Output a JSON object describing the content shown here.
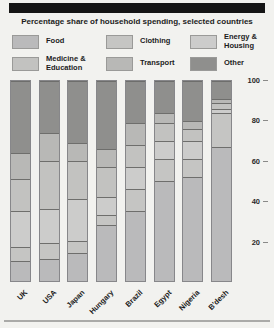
{
  "title": "Percentage share of household spending, selected countries",
  "chart_data": {
    "type": "bar",
    "subtype": "stacked-percentage-column",
    "title": "Percentage share of household spending, selected countries",
    "categories": [
      "UK",
      "USA",
      "Japan",
      "Hungary",
      "Brazil",
      "Egypt",
      "Nigeria",
      "B'desh"
    ],
    "series": [
      {
        "name": "Food",
        "color": "#bababb",
        "values": [
          10,
          11,
          14,
          28,
          35,
          50,
          52,
          67
        ]
      },
      {
        "name": "Clothing",
        "color": "#c5c5c3",
        "values": [
          7,
          8,
          6,
          5,
          11,
          11,
          9,
          17
        ]
      },
      {
        "name": "Energy & Housing",
        "color": "#cccccb",
        "values": [
          18,
          17,
          21,
          9,
          11,
          9,
          9,
          2
        ]
      },
      {
        "name": "Medicine & Education",
        "color": "#c2c2c0",
        "values": [
          16,
          24,
          19,
          15,
          11,
          9,
          6,
          3
        ]
      },
      {
        "name": "Transport",
        "color": "#b8b8b6",
        "values": [
          13,
          14,
          9,
          9,
          11,
          5,
          4,
          2
        ]
      },
      {
        "name": "Other",
        "color": "#8f8f8d",
        "values": [
          36,
          26,
          31,
          34,
          21,
          16,
          20,
          9
        ]
      }
    ],
    "stack_order": "bottom-to-top",
    "ylim": [
      0,
      100
    ],
    "yticks": [
      100,
      80,
      60,
      40,
      20
    ],
    "grid": false,
    "legend_position": "top",
    "legend_display_order": [
      "Food",
      "Clothing",
      "Energy & Housing",
      "Medicine & Education",
      "Transport",
      "Other"
    ]
  },
  "colors": {
    "background": "#f2f2ef",
    "top_bar": "#151515",
    "separator_line": "#6e6e6c",
    "bar_border": "#87878a",
    "other_dark": "#8f8f8d"
  }
}
